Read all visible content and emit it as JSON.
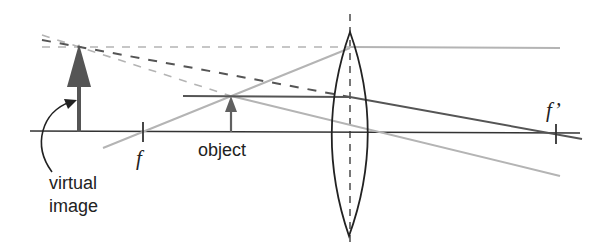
{
  "diagram": {
    "type": "converging-lens-magnifier-ray-diagram",
    "labels": {
      "focal_left": "f",
      "focal_right": "f’",
      "object": "object",
      "virtual_image_line1": "virtual",
      "virtual_image_line2": "image"
    },
    "colors": {
      "axis": "#333333",
      "lens": "#222222",
      "dark_ray": "#555555",
      "light_ray": "#b4b4b4",
      "object_arrow": "#606060",
      "image_arrow": "#555555"
    },
    "geometry": {
      "optical_axis_y": 132,
      "lens_center_x": 350,
      "focal_left_x": 143,
      "focal_right_x": 556,
      "object_x": 231,
      "object_top_y": 96,
      "image_x": 79,
      "image_top_y": 44
    }
  }
}
